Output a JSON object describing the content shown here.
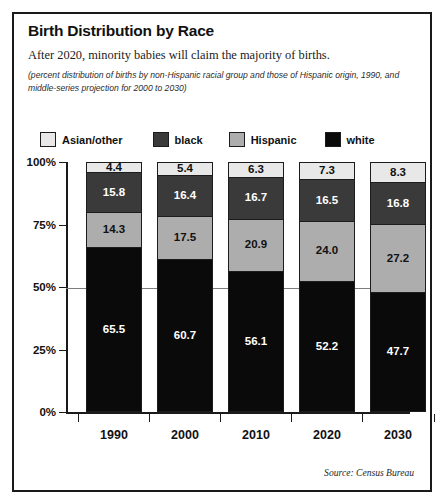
{
  "figure": {
    "title": "Birth Distribution by Race",
    "subtitle": "After 2020, minority babies will claim the majority of births.",
    "note": "(percent distribution of births by non-Hispanic racial group and those of Hispanic origin, 1990, and middle-series projection for 2000 to 2030)",
    "source": "Source: Census Bureau"
  },
  "legend": {
    "items": [
      {
        "label": "Asian/other",
        "color": "#e8e8e8"
      },
      {
        "label": "black",
        "color": "#3a3a3a"
      },
      {
        "label": "Hispanic",
        "color": "#adadad"
      },
      {
        "label": "white",
        "color": "#0a0a0a"
      }
    ]
  },
  "axis": {
    "yticks": [
      "100%",
      "75%",
      "50%",
      "25%",
      "0%"
    ],
    "xticks": [
      "1990",
      "2000",
      "2010",
      "2020",
      "2030"
    ]
  },
  "chart_data": {
    "type": "bar",
    "title": "Birth Distribution by Race",
    "subtitle": "After 2020, minority babies will claim the majority of births.",
    "annotation": "(percent distribution of births by non-Hispanic racial group and those of Hispanic origin, 1990, and middle-series projection for 2000 to 2030)",
    "source": "Source: Census Bureau",
    "stacked": true,
    "stack_order_bottom_to_top": [
      "white",
      "Hispanic",
      "black",
      "Asian/other"
    ],
    "xlabel": "",
    "ylabel": "",
    "ylim": [
      0,
      100
    ],
    "yticks": [
      0,
      25,
      50,
      75,
      100
    ],
    "ytick_labels": [
      "0%",
      "25%",
      "50%",
      "75%",
      "100%"
    ],
    "grid": "50% reference line only",
    "legend_position": "top",
    "categories": [
      "1990",
      "2000",
      "2010",
      "2020",
      "2030"
    ],
    "series": [
      {
        "name": "Asian/other",
        "color": "#e8e8e8",
        "text_color": "#111111",
        "values": [
          4.4,
          5.4,
          6.3,
          7.3,
          8.3
        ]
      },
      {
        "name": "black",
        "color": "#3a3a3a",
        "text_color": "#ffffff",
        "values": [
          15.8,
          16.4,
          16.7,
          16.5,
          16.8
        ]
      },
      {
        "name": "Hispanic",
        "color": "#adadad",
        "text_color": "#111111",
        "values": [
          14.3,
          17.5,
          20.9,
          24.0,
          27.2
        ]
      },
      {
        "name": "white",
        "color": "#0a0a0a",
        "text_color": "#ffffff",
        "values": [
          65.5,
          60.7,
          56.1,
          52.2,
          47.7
        ]
      }
    ],
    "value_labels": [
      {
        "category": "1990",
        "Asian/other": "4.4",
        "black": "15.8",
        "Hispanic": "14.3",
        "white": "65.5"
      },
      {
        "category": "2000",
        "Asian/other": "5.4",
        "black": "16.4",
        "Hispanic": "17.5",
        "white": "60.7"
      },
      {
        "category": "2010",
        "Asian/other": "6.3",
        "black": "16.7",
        "Hispanic": "20.9",
        "white": "56.1"
      },
      {
        "category": "2020",
        "Asian/other": "7.3",
        "black": "16.5",
        "Hispanic": "16.5",
        "white": "52.2"
      },
      {
        "category": "2030",
        "Asian/other": "8.3",
        "black": "16.8",
        "Hispanic": "27.2",
        "white": "47.7"
      }
    ]
  }
}
